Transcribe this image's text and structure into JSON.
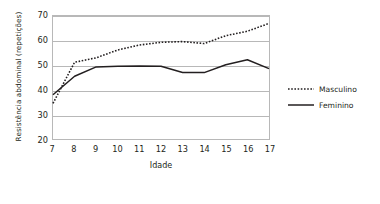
{
  "chart_data": {
    "type": "line",
    "title": "",
    "xlabel": "Idade",
    "ylabel": "Resistência abdominal (repetições)",
    "x": [
      7,
      8,
      9,
      10,
      11,
      12,
      13,
      14,
      15,
      16,
      17
    ],
    "xtick_labels": [
      "7",
      "8",
      "9",
      "10",
      "11",
      "12",
      "13",
      "14",
      "15",
      "16",
      "17"
    ],
    "ytick_labels": [
      "20",
      "30",
      "40",
      "50",
      "60",
      "70"
    ],
    "yticks": [
      20,
      30,
      40,
      50,
      60,
      70
    ],
    "xlim": [
      7,
      17
    ],
    "ylim": [
      20,
      70
    ],
    "grid": "horizontal",
    "legend_position": "right",
    "series": [
      {
        "name": "Masculino",
        "style": "dotted",
        "color": "#231f20",
        "values": [
          34.5,
          51.2,
          53.0,
          56.2,
          58.2,
          59.3,
          59.6,
          58.8,
          62.0,
          63.8,
          67.0
        ]
      },
      {
        "name": "Feminino",
        "style": "solid",
        "color": "#231f20",
        "values": [
          38.0,
          45.5,
          49.3,
          49.6,
          49.7,
          49.6,
          47.0,
          47.0,
          50.2,
          52.2,
          48.6
        ]
      }
    ]
  },
  "legend": {
    "items": [
      {
        "label": "Masculino",
        "style": "dotted"
      },
      {
        "label": "Feminino",
        "style": "solid"
      }
    ]
  }
}
